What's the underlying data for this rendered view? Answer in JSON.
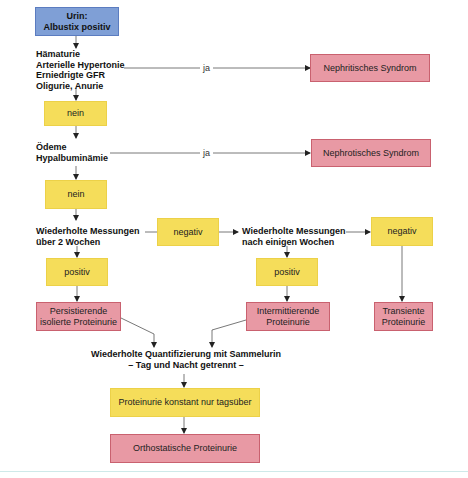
{
  "colors": {
    "start_box": "#7f9fd6",
    "decision_box": "#f5dd5a",
    "result_box": "#e899a4",
    "line": "#555555"
  },
  "nodes": {
    "start": "Urin:\nAlbustix positiv",
    "q1": "Hämaturie\nArterielle Hypertonie\nErniedrigte GFR\nOligurie, Anurie",
    "q1_no": "nein",
    "q1_yes_label": "ja",
    "nephritic": "Nephritisches Syndrom",
    "q2": "Ödeme\nHypalbuminämie",
    "q2_no": "nein",
    "q2_yes_label": "ja",
    "nephrotic": "Nephrotisches Syndrom",
    "q3": "Wiederholte Messungen\nüber 2 Wochen",
    "q3_neg": "negativ",
    "q3_pos": "positiv",
    "persistent": "Persistierende\nisolierte Proteinurie",
    "q4": "Wiederholte Messungen\nnach einigen Wochen",
    "q4_neg": "negativ",
    "q4_pos": "positiv",
    "intermittent": "Intermittierende\nProteinurie",
    "transient": "Transiente\nProteinurie",
    "q5": "Wiederholte Quantifizierung mit Sammelurin\n– Tag und Nacht getrennt –",
    "daytime": "Proteinurie konstant nur tagsüber",
    "orthostatic": "Orthostatische Proteinurie"
  }
}
